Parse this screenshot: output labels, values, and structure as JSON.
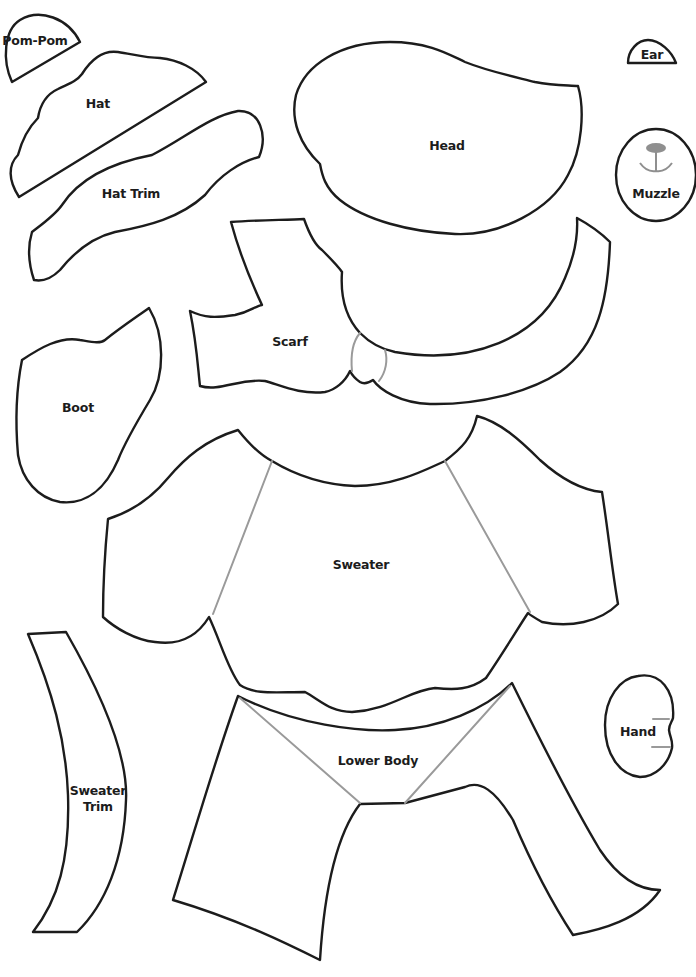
{
  "sheet": {
    "title": "Snowman / Teddy craft pattern pieces",
    "line_color": "#1c1c1c",
    "guide_color": "#9a9a9a",
    "background": "#ffffff"
  },
  "pieces": {
    "pom_pom": {
      "label": "Pom-Pom"
    },
    "hat": {
      "label": "Hat"
    },
    "hat_trim": {
      "label": "Hat Trim"
    },
    "head": {
      "label": "Head"
    },
    "ear": {
      "label": "Ear"
    },
    "muzzle": {
      "label": "Muzzle"
    },
    "scarf": {
      "label": "Scarf"
    },
    "boot": {
      "label": "Boot"
    },
    "sweater": {
      "label": "Sweater"
    },
    "sweater_trim": {
      "label_line1": "Sweater",
      "label_line2": "Trim"
    },
    "lower_body": {
      "label": "Lower Body"
    },
    "hand": {
      "label": "Hand"
    }
  }
}
